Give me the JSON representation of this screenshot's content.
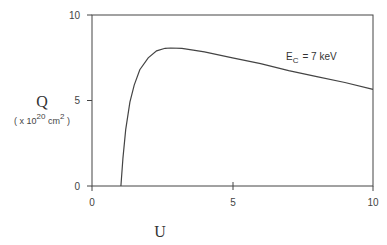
{
  "chart_data": {
    "type": "line",
    "title": "",
    "xlabel": "U",
    "ylabel": "Q",
    "ylabel_unit": "( x 10^20 cm^2 )",
    "xlim": [
      0,
      10
    ],
    "ylim": [
      0,
      10
    ],
    "xticks": [
      "0",
      "5",
      "10"
    ],
    "yticks": [
      "0",
      "5",
      "10"
    ],
    "grid": false,
    "legend": null,
    "annotations": [
      {
        "text": "E_C = 7 keV",
        "x": 6.5,
        "y": 7.5
      }
    ],
    "series": [
      {
        "name": "E_C = 7 keV",
        "x": [
          1.03,
          1.1,
          1.2,
          1.35,
          1.5,
          1.7,
          2.0,
          2.3,
          2.6,
          2.8,
          3.2,
          3.6,
          4.0,
          5.0,
          6.0,
          7.0,
          8.0,
          9.0,
          10.0
        ],
        "y": [
          0.0,
          1.6,
          3.3,
          4.9,
          5.9,
          6.8,
          7.5,
          7.9,
          8.05,
          8.07,
          8.05,
          7.95,
          7.85,
          7.5,
          7.15,
          6.75,
          6.4,
          6.05,
          5.65
        ]
      }
    ]
  },
  "labels": {
    "x_axis": "U",
    "y_axis": "Q",
    "y_unit_prefix": "( x 10",
    "y_unit_exp": "20",
    "y_unit_mid": " cm",
    "y_unit_exp2": "2",
    "y_unit_suffix": " )",
    "annotation_E": "E",
    "annotation_sub": "C",
    "annotation_rest": "= 7 keV",
    "xtick0": "0",
    "xtick5": "5",
    "xtick10": "10",
    "ytick0": "0",
    "ytick5": "5",
    "ytick10": "10"
  }
}
